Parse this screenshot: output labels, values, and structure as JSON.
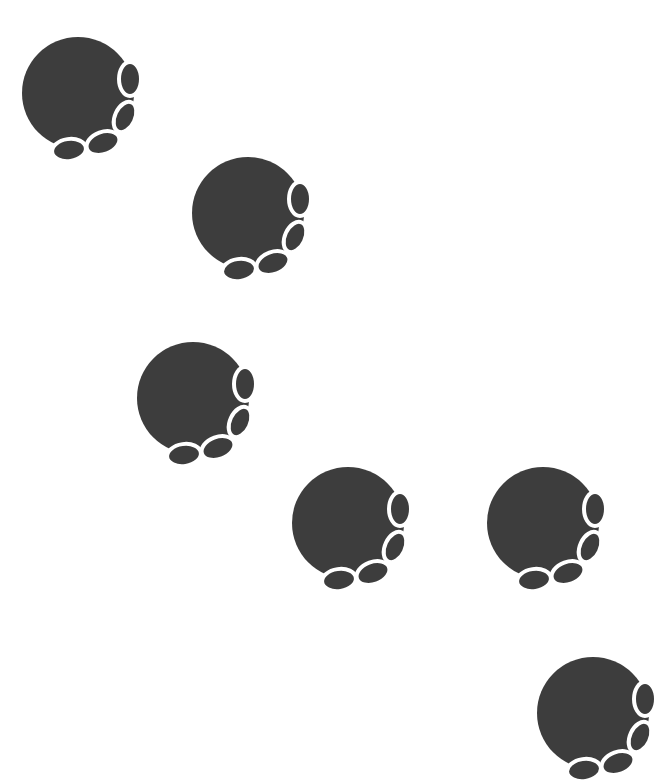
{
  "canvas": {
    "width": 650,
    "height": 746,
    "background": "#ffffff"
  },
  "colors": {
    "pad": "#3d3d3d",
    "outline": "#ffffff"
  },
  "paws": [
    {
      "id": 1,
      "icon": "paw-print-icon",
      "x": 20,
      "y": 35
    },
    {
      "id": 2,
      "icon": "paw-print-icon",
      "x": 190,
      "y": 155
    },
    {
      "id": 3,
      "icon": "paw-print-icon",
      "x": 135,
      "y": 340
    },
    {
      "id": 4,
      "icon": "paw-print-icon",
      "x": 290,
      "y": 465
    },
    {
      "id": 5,
      "icon": "paw-print-icon",
      "x": 485,
      "y": 465
    },
    {
      "id": 6,
      "icon": "paw-print-icon",
      "x": 535,
      "y": 655
    }
  ]
}
